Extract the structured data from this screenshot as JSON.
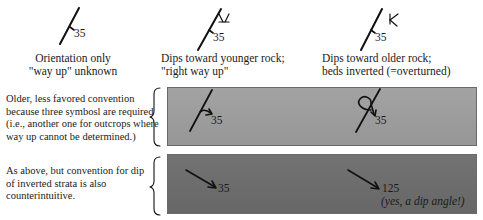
{
  "columns": [
    {
      "symbol": "strike-dip-plain",
      "dip": "35",
      "caption_lines": [
        "Orientation only",
        "\"way up\" unknown"
      ]
    },
    {
      "symbol": "strike-dip-upright-younging",
      "dip": "35",
      "caption_lines": [
        "Dips toward younger rock;",
        "\"right way up\""
      ]
    },
    {
      "symbol": "strike-dip-overturned-younging",
      "dip": "35",
      "caption_lines": [
        "Dips toward older rock;",
        "beds inverted  (=overturned)"
      ]
    }
  ],
  "rows": [
    {
      "note_lines": [
        "Older, less favored convention",
        "because three symbosl are required",
        "(i.e., another one for outcrops where",
        "way up cannot be determined.)"
      ],
      "band_color": "#9a9a9a",
      "upright": {
        "symbol": "strike-with-arrow",
        "dip": "35"
      },
      "overturned": {
        "symbol": "strike-with-looped-arrow",
        "dip": "35"
      }
    },
    {
      "note_lines": [
        "As above, but convention for dip",
        "of inverted strata is also",
        " counterintuitive."
      ],
      "band_color": "#6e6e6e",
      "upright": {
        "symbol": "dip-arrow",
        "dip": "35"
      },
      "overturned": {
        "symbol": "dip-arrow",
        "dip": "125",
        "remark": "(yes, a dip angle!)"
      }
    }
  ],
  "colors": {
    "ink": "#1a1a1a",
    "band_light": "#9a9a9a",
    "band_dark": "#6e6e6e",
    "background": "#ffffff"
  }
}
